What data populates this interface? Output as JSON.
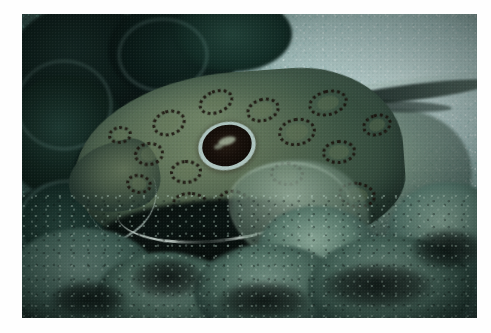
{
  "image": {
    "domain": "Natural-Image",
    "kind": "underwater-photograph",
    "subject": "spotted ray (skate / electric ray) resting camouflaged on a reef seabed",
    "orientation": "landscape",
    "canvas": {
      "width": 491,
      "height": 333
    },
    "border": {
      "style": "white photographic print border",
      "color": "#fefefe",
      "left": 22,
      "top": 14,
      "right": 14,
      "bottom": 15
    },
    "photo_area": {
      "x": 22,
      "y": 14,
      "width": 455,
      "height": 304
    }
  },
  "palette": {
    "sand_light": "#cfe0dd",
    "sand_mid": "#9fb9b6",
    "water_teal": "#41605a",
    "shadow_dark": "#0b1a16",
    "ray_body_olive": "#7e8f6e",
    "ray_body_mid": "#63765c",
    "spot_dark": "#1c120c",
    "eye_ring_pale": "#cfe1dc",
    "lip_white": "#f4faf4",
    "algae_green": "#5f8274"
  },
  "subjects": {
    "ray": {
      "label": "spotted ray",
      "position": "centre-left, head facing left",
      "features": [
        {
          "name": "eye",
          "note": "large dark oval eye with pale cyan ring",
          "x": 205,
          "y": 132
        },
        {
          "name": "snout",
          "note": "rounded pointed snout at far left",
          "x": 95,
          "y": 165
        },
        {
          "name": "white-lip",
          "note": "bright white leading edge beneath the head",
          "x": 190,
          "y": 222
        },
        {
          "name": "pectoral-fin",
          "note": "pale pectoral fin lobe, lower centre-right",
          "x": 278,
          "y": 200
        },
        {
          "name": "tail",
          "note": "slender dark tail extending to the right edge",
          "x": 392,
          "y": 92
        },
        {
          "name": "rosette-spots",
          "note": "dark leopard-like rosette spot clusters across the disc"
        }
      ]
    },
    "background": {
      "label": "reef seabed",
      "elements": [
        {
          "name": "dark-coral",
          "note": "dark teal coral lobes, upper-left quadrant"
        },
        {
          "name": "sand-gravel",
          "note": "bright speckled shell gravel, upper-right quadrant"
        },
        {
          "name": "rubble-algae",
          "note": "pale green algae-covered rubble along the bottom"
        }
      ]
    }
  },
  "rosettes": [
    {
      "x": 130,
      "y": 96,
      "w": 34,
      "h": 26,
      "r": -18
    },
    {
      "x": 112,
      "y": 128,
      "w": 30,
      "h": 24,
      "r": -8
    },
    {
      "x": 104,
      "y": 160,
      "w": 26,
      "h": 20,
      "r": 10
    },
    {
      "x": 148,
      "y": 146,
      "w": 32,
      "h": 24,
      "r": -4
    },
    {
      "x": 150,
      "y": 178,
      "w": 38,
      "h": 26,
      "r": 6
    },
    {
      "x": 196,
      "y": 176,
      "w": 34,
      "h": 24,
      "r": 14
    },
    {
      "x": 176,
      "y": 76,
      "w": 36,
      "h": 24,
      "r": -22
    },
    {
      "x": 224,
      "y": 84,
      "w": 34,
      "h": 24,
      "r": -16
    },
    {
      "x": 256,
      "y": 104,
      "w": 38,
      "h": 28,
      "r": -10
    },
    {
      "x": 248,
      "y": 148,
      "w": 34,
      "h": 24,
      "r": 4
    },
    {
      "x": 286,
      "y": 76,
      "w": 40,
      "h": 26,
      "r": -14
    },
    {
      "x": 300,
      "y": 126,
      "w": 34,
      "h": 24,
      "r": -6
    },
    {
      "x": 316,
      "y": 168,
      "w": 38,
      "h": 26,
      "r": 8
    },
    {
      "x": 206,
      "y": 206,
      "w": 32,
      "h": 22,
      "r": 12
    },
    {
      "x": 340,
      "y": 100,
      "w": 30,
      "h": 22,
      "r": -18
    },
    {
      "x": 86,
      "y": 112,
      "w": 24,
      "h": 18,
      "r": -6
    }
  ]
}
